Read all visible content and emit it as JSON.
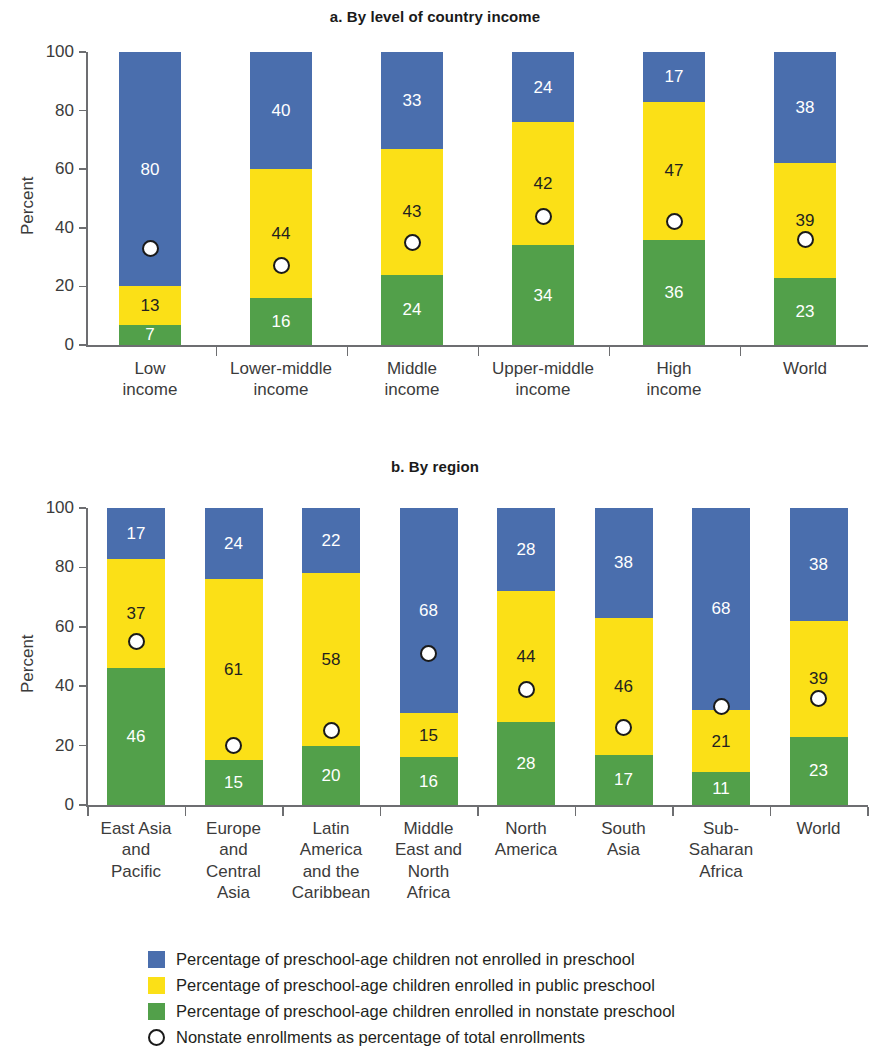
{
  "figure": {
    "y_axis_label": "Percent",
    "panels": [
      {
        "id": "panel-a",
        "title": "a. By level of country income",
        "categories": [
          "Low\nincome",
          "Lower-middle\nincome",
          "Middle\nincome",
          "Upper-middle\nincome",
          "High\nincome",
          "World"
        ],
        "nonstate": [
          7,
          16,
          24,
          34,
          36,
          23
        ],
        "public": [
          13,
          44,
          43,
          42,
          47,
          39
        ],
        "not_enrolled": [
          80,
          40,
          33,
          24,
          17,
          38
        ],
        "marker_values": [
          33,
          27,
          35,
          44,
          42,
          36
        ],
        "yticks": [
          0,
          20,
          40,
          60,
          80,
          100
        ]
      },
      {
        "id": "panel-b",
        "title": "b. By region",
        "categories": [
          "East Asia\nand\nPacific",
          "Europe\nand\nCentral\nAsia",
          "Latin\nAmerica\nand the\nCaribbean",
          "Middle\nEast and\nNorth\nAfrica",
          "North\nAmerica",
          "South\nAsia",
          "Sub-\nSaharan\nAfrica",
          "World"
        ],
        "nonstate": [
          46,
          15,
          20,
          16,
          28,
          17,
          11,
          23
        ],
        "public": [
          37,
          61,
          58,
          15,
          44,
          46,
          21,
          39
        ],
        "not_enrolled": [
          17,
          24,
          22,
          68,
          28,
          38,
          68,
          38
        ],
        "marker_values": [
          55,
          20,
          25,
          51,
          39,
          26,
          33,
          36
        ],
        "yticks": [
          0,
          20,
          40,
          60,
          80,
          100
        ]
      }
    ]
  },
  "legend": {
    "items": [
      {
        "marker": "square-blue",
        "color": "#4a6ead",
        "label": "Percentage of preschool-age children not enrolled in preschool"
      },
      {
        "marker": "square-yellow",
        "color": "#fbe017",
        "label": "Percentage of preschool-age children enrolled in public preschool"
      },
      {
        "marker": "square-green",
        "color": "#52a04a",
        "label": "Percentage of preschool-age children enrolled in nonstate preschool"
      },
      {
        "marker": "open-circle",
        "color": "#1a1a1a",
        "label": "Nonstate enrollments as percentage of total enrollments"
      }
    ]
  },
  "colors": {
    "not_enrolled": "#4a6ead",
    "public": "#fbe017",
    "nonstate": "#52a04a",
    "marker_fill": "#ffffff",
    "marker_stroke": "#1a1a1a",
    "axis": "#6d6e71",
    "text": "#231f20"
  },
  "chart_data": {
    "type": "bar",
    "subtitle": "",
    "xlabel": "",
    "ylabel": "Percent",
    "ylim": [
      0,
      100
    ],
    "grid": false,
    "stacked": true,
    "stack_order_bottom_to_top": [
      "nonstate preschool",
      "public preschool",
      "not enrolled"
    ],
    "legend_position": "bottom",
    "panels": [
      {
        "panel": "a. By level of country income",
        "categories": [
          "Low income",
          "Lower-middle income",
          "Middle income",
          "Upper-middle income",
          "High income",
          "World"
        ],
        "series": [
          {
            "name": "Percentage of preschool-age children enrolled in nonstate preschool",
            "color": "#52a04a",
            "values": [
              7,
              16,
              24,
              34,
              36,
              23
            ]
          },
          {
            "name": "Percentage of preschool-age children enrolled in public preschool",
            "color": "#fbe017",
            "values": [
              13,
              44,
              43,
              42,
              47,
              39
            ]
          },
          {
            "name": "Percentage of preschool-age children not enrolled in preschool",
            "color": "#4a6ead",
            "values": [
              80,
              40,
              33,
              24,
              17,
              38
            ]
          }
        ],
        "overlay": {
          "type": "scatter",
          "name": "Nonstate enrollments as percentage of total enrollments",
          "marker": "open-circle",
          "values": [
            33,
            27,
            35,
            44,
            42,
            36
          ]
        },
        "yticks": [
          0,
          20,
          40,
          60,
          80,
          100
        ]
      },
      {
        "panel": "b. By region",
        "categories": [
          "East Asia and Pacific",
          "Europe and Central Asia",
          "Latin America and the Caribbean",
          "Middle East and North Africa",
          "North America",
          "South Asia",
          "Sub-Saharan Africa",
          "World"
        ],
        "series": [
          {
            "name": "Percentage of preschool-age children enrolled in nonstate preschool",
            "color": "#52a04a",
            "values": [
              46,
              15,
              20,
              16,
              28,
              17,
              11,
              23
            ]
          },
          {
            "name": "Percentage of preschool-age children enrolled in public preschool",
            "color": "#fbe017",
            "values": [
              37,
              61,
              58,
              15,
              44,
              46,
              21,
              39
            ]
          },
          {
            "name": "Percentage of preschool-age children not enrolled in preschool",
            "color": "#4a6ead",
            "values": [
              17,
              24,
              22,
              68,
              28,
              38,
              68,
              38
            ]
          }
        ],
        "overlay": {
          "type": "scatter",
          "name": "Nonstate enrollments as percentage of total enrollments",
          "marker": "open-circle",
          "values": [
            55,
            20,
            25,
            51,
            39,
            26,
            33,
            36
          ]
        },
        "yticks": [
          0,
          20,
          40,
          60,
          80,
          100
        ]
      }
    ]
  }
}
